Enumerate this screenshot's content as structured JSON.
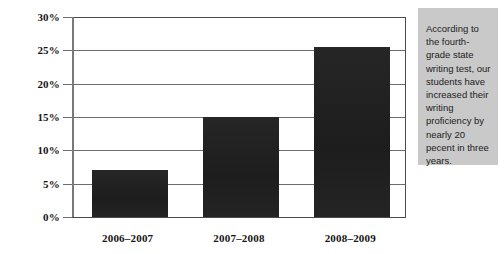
{
  "chart_data": {
    "type": "bar",
    "title": "",
    "xlabel": "",
    "ylabel": "",
    "categories": [
      "2006–2007",
      "2007–2008",
      "2008–2009"
    ],
    "values": [
      7,
      15,
      25.5
    ],
    "value_unit": "%",
    "ylim": [
      0,
      30
    ],
    "ytick_step": 5,
    "ytick_labels": [
      "0%",
      "5%",
      "10%",
      "15%",
      "20%",
      "25%",
      "30%"
    ],
    "ytick_values": [
      0,
      5,
      10,
      15,
      20,
      25,
      30
    ],
    "grid": true,
    "legend": false,
    "series": [
      {
        "name": "Writing proficiency",
        "values": [
          7,
          15,
          25.5
        ],
        "color": "#232323"
      }
    ]
  },
  "colors": {
    "bar": "#232323",
    "gridline": "#6d6d6d",
    "axis": "#4a4a4a",
    "callout_background": "#c9c9c9",
    "text": "#141414"
  },
  "callout": {
    "text": "According to the fourth-grade state writing test, our students have increased their writing proficiency by nearly 20 pecent in three years."
  }
}
